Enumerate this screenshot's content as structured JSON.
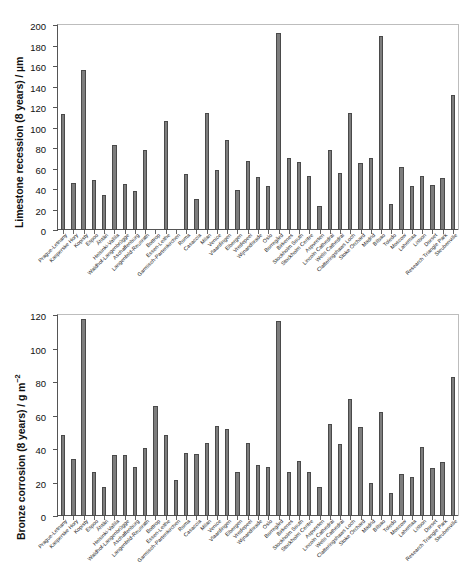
{
  "figure": {
    "background": "#ffffff",
    "bar_color": "#7d7d7d",
    "bar_edge_color": "#4a4a4a",
    "axis_color": "#555555"
  },
  "categories": [
    "Prague-Letnany",
    "Kasperske Hory",
    "Kopisty",
    "Espoo",
    "Ähtäri",
    "Helsinki-Vallila",
    "Waldhof-Langenbrügge",
    "Aschaffenburg",
    "Langenfeld-Reusrath",
    "Bottrop",
    "Essen-Leithe",
    "Garmisch-Partenkirchen",
    "Roma",
    "Casaccia",
    "Milan",
    "Venice",
    "Vlaardingen",
    "Elbergen",
    "Vredepeel",
    "Wijnandsrade",
    "Oslo",
    "Borregård",
    "Birkenes",
    "Stockholm South",
    "Stockholm Centre",
    "Aspvreten",
    "Lincoln Cathedral",
    "Wells Cathedral",
    "Clatteringshaws Loch",
    "Stoke Orchard",
    "Madrid",
    "Bilbao",
    "Toledo",
    "Moscow",
    "Lahemaa",
    "Lisbon",
    "Dorset",
    "Research Triangle Park",
    "Steubenville"
  ],
  "chart_data": [
    {
      "id": "limestone",
      "type": "bar",
      "title": "",
      "ylabel": "Limestone recession (8 years) / µm",
      "ylabel_parts": {
        "text": "Limestone recession (8 years) / µm"
      },
      "xlabel": "",
      "ylim": [
        0,
        200
      ],
      "yticks": [
        0,
        20,
        40,
        60,
        80,
        100,
        120,
        140,
        160,
        180,
        200
      ],
      "grid": false,
      "legend": "none",
      "values": [
        113.5,
        45.5,
        156.5,
        48.5,
        34.0,
        82.5,
        44.5,
        38.5,
        78.5,
        null,
        106.5,
        null,
        54.5,
        30.5,
        114.0,
        59.0,
        87.5,
        39.0,
        67.0,
        52.0,
        42.5,
        192.5,
        70.0,
        66.5,
        53.0,
        23.5,
        78.0,
        55.5,
        114.5,
        65.0,
        70.5,
        189.0,
        25.0,
        61.5,
        43.0,
        52.5,
        43.5,
        50.5,
        131.5
      ]
    },
    {
      "id": "bronze",
      "type": "bar",
      "title": "",
      "ylabel": "Bronze corrosion (8 years) / g m⁻²",
      "xlabel": "",
      "ylim": [
        0,
        120
      ],
      "yticks": [
        0,
        20,
        40,
        60,
        80,
        100,
        120
      ],
      "grid": false,
      "legend": "none",
      "values": [
        48.5,
        34.0,
        117.5,
        26.0,
        17.5,
        36.5,
        36.5,
        29.5,
        40.5,
        65.5,
        48.5,
        21.5,
        37.5,
        37.0,
        43.5,
        53.5,
        52.0,
        26.0,
        43.5,
        30.5,
        29.0,
        116.5,
        26.5,
        33.0,
        26.0,
        17.5,
        55.0,
        43.0,
        70.0,
        53.0,
        20.0,
        62.0,
        14.0,
        25.0,
        23.5,
        41.0,
        28.5,
        32.0,
        83.0
      ]
    }
  ]
}
